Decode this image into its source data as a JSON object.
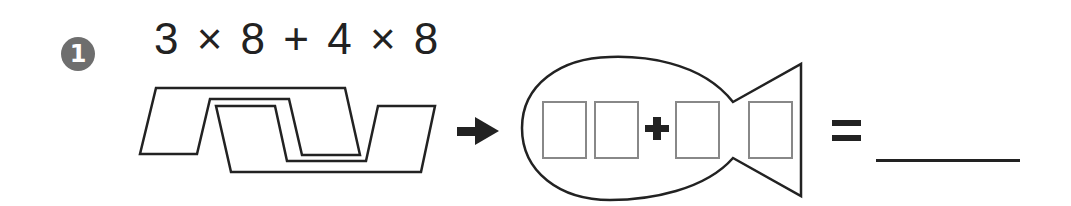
{
  "problem": {
    "number": "1",
    "expression": "3 × 8 + 4 × 8",
    "operator_plus": "+",
    "equals": "=",
    "answer": ""
  },
  "colors": {
    "ink": "#222222",
    "badge": "#6e6e6e",
    "box_outline": "#888888"
  },
  "icons": [
    "number-badge-icon",
    "overlapping-shapes-diagram",
    "right-arrow-icon",
    "fish-shape",
    "answer-box"
  ]
}
